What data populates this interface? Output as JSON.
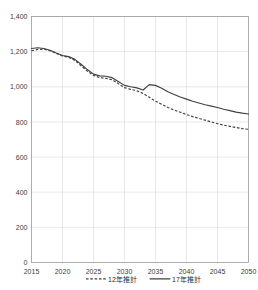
{
  "top_text": "",
  "chart_data": {
    "type": "line",
    "title": "",
    "subtitle": "",
    "xlabel": "",
    "ylabel": "",
    "xlim": [
      2015,
      2050
    ],
    "ylim": [
      0,
      1400
    ],
    "ytick_values": [
      0,
      200,
      400,
      600,
      800,
      1000,
      1200,
      1400
    ],
    "ytick_labels": [
      "0",
      "200",
      "400",
      "600",
      "800",
      "1,000",
      "1,200",
      "1,400"
    ],
    "xtick_values": [
      2015,
      2020,
      2025,
      2030,
      2035,
      2040,
      2045,
      2050
    ],
    "xtick_labels": [
      "2015",
      "2020",
      "2025",
      "2030",
      "2035",
      "2040",
      "2045",
      "2050"
    ],
    "grid": true,
    "legend_position": "bottom",
    "x": [
      2015,
      2016,
      2017,
      2018,
      2019,
      2020,
      2021,
      2022,
      2023,
      2024,
      2025,
      2026,
      2027,
      2028,
      2029,
      2030,
      2031,
      2032,
      2033,
      2034,
      2035,
      2036,
      2037,
      2038,
      2039,
      2040,
      2041,
      2042,
      2043,
      2044,
      2045,
      2046,
      2047,
      2048,
      2049,
      2050
    ],
    "series": [
      {
        "name": "12年推計",
        "style": "dashed",
        "color": "#404040",
        "values": [
          1205,
          1212,
          1214,
          1205,
          1190,
          1175,
          1168,
          1150,
          1120,
          1090,
          1065,
          1052,
          1048,
          1040,
          1018,
          995,
          985,
          978,
          962,
          940,
          918,
          900,
          882,
          868,
          855,
          842,
          830,
          820,
          810,
          800,
          790,
          782,
          775,
          768,
          762,
          758
        ]
      },
      {
        "name": "17年推計",
        "style": "solid",
        "color": "#404040",
        "values": [
          1218,
          1222,
          1218,
          1208,
          1192,
          1178,
          1172,
          1156,
          1128,
          1098,
          1072,
          1062,
          1060,
          1052,
          1030,
          1008,
          1000,
          994,
          982,
          1012,
          1008,
          992,
          972,
          956,
          942,
          930,
          918,
          908,
          898,
          890,
          882,
          872,
          864,
          856,
          850,
          845
        ]
      }
    ]
  },
  "legend": {
    "items": [
      {
        "label": "12年推計",
        "style": "dashed"
      },
      {
        "label": "17年推計",
        "style": "solid"
      }
    ]
  }
}
